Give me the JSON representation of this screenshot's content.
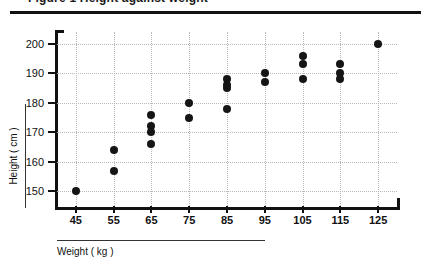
{
  "header": {
    "clipped_text": "Figure 1  Height against weight"
  },
  "chart_data": {
    "type": "scatter",
    "title": "",
    "xlabel": "Weight ( kg )",
    "ylabel": "Height ( cm )",
    "xlim": [
      40,
      130
    ],
    "ylim": [
      145,
      204
    ],
    "xticks": [
      45,
      55,
      65,
      75,
      85,
      95,
      105,
      115,
      125
    ],
    "yticks": [
      150,
      160,
      170,
      180,
      190,
      200
    ],
    "grid": true,
    "legend": false,
    "marker": "filled-circle",
    "marker_color": "#151515",
    "points": [
      {
        "x": 45,
        "y": 150
      },
      {
        "x": 55,
        "y": 157
      },
      {
        "x": 55,
        "y": 164
      },
      {
        "x": 65,
        "y": 166
      },
      {
        "x": 65,
        "y": 170
      },
      {
        "x": 65,
        "y": 172
      },
      {
        "x": 65,
        "y": 176
      },
      {
        "x": 75,
        "y": 175
      },
      {
        "x": 75,
        "y": 180
      },
      {
        "x": 85,
        "y": 178
      },
      {
        "x": 85,
        "y": 185
      },
      {
        "x": 85,
        "y": 186
      },
      {
        "x": 85,
        "y": 188
      },
      {
        "x": 95,
        "y": 187
      },
      {
        "x": 95,
        "y": 190
      },
      {
        "x": 105,
        "y": 188
      },
      {
        "x": 105,
        "y": 193
      },
      {
        "x": 105,
        "y": 196
      },
      {
        "x": 115,
        "y": 188
      },
      {
        "x": 115,
        "y": 190
      },
      {
        "x": 115,
        "y": 193
      },
      {
        "x": 125,
        "y": 200
      }
    ]
  }
}
